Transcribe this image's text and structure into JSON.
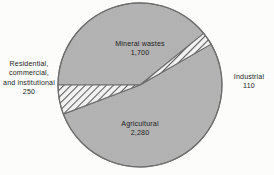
{
  "figure": {
    "background_color": "#fdfdfc",
    "wedge_fill_color": "#b3b3b3",
    "wedge_stroke_color": "#6f6f6f",
    "hatch_fill_color": "#f2f2f2",
    "hatch_line_color": "#5d5d5d",
    "text_color": "#1d1d1d"
  },
  "geometry": {
    "center_x": 140,
    "center_y": 85,
    "radius": 82
  },
  "labels": {
    "mineral": {
      "name": "Mineral wastes",
      "value": "1,700"
    },
    "agricultural": {
      "name": "Agricultural",
      "value": "2,280"
    },
    "residential": {
      "name": "Residential,\ncommercial,\nand institutional",
      "value": "250"
    },
    "industrial": {
      "name": "Industrial",
      "value": "110"
    }
  },
  "chart_data": {
    "type": "pie",
    "title": "",
    "subtitle": "",
    "xlabel": "",
    "ylabel": "",
    "grid": false,
    "legend_position": "none",
    "total": 4340,
    "value_unit": "million tons per year",
    "categories": [
      "Mineral wastes",
      "Agricultural",
      "Residential, commercial, and institutional",
      "Industrial"
    ],
    "values": [
      1700,
      2280,
      250,
      110
    ],
    "slices": [
      {
        "label": "Mineral wastes",
        "value": 1700,
        "percent": 39.2,
        "fill": "solid-gray",
        "start_angle_deg": 180,
        "end_angle_deg": 321.0,
        "label_placement": "inside-top"
      },
      {
        "label": "Industrial",
        "value": 110,
        "percent": 2.5,
        "fill": "diagonal-hatch",
        "start_angle_deg": 321.0,
        "end_angle_deg": 330.1,
        "label_placement": "outside-right"
      },
      {
        "label": "Agricultural",
        "value": 2280,
        "percent": 52.5,
        "fill": "solid-gray",
        "start_angle_deg": 330.1,
        "end_angle_deg": 519.2,
        "label_placement": "inside-bottom"
      },
      {
        "label": "Residential, commercial, and institutional",
        "value": 250,
        "percent": 5.8,
        "fill": "diagonal-hatch",
        "start_angle_deg": 519.2,
        "end_angle_deg": 540.0,
        "label_placement": "outside-left"
      }
    ]
  }
}
